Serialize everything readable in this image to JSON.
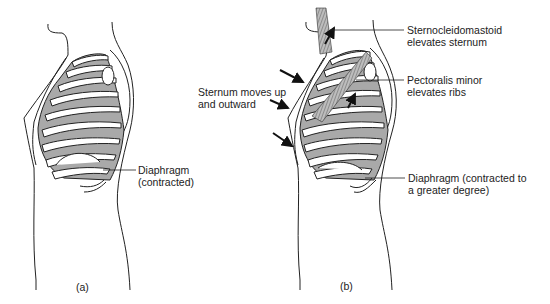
{
  "figure": {
    "panel_a": {
      "caption": "(a)",
      "labels": {
        "diaphragm_line1": "Diaphragm",
        "diaphragm_line2": "(contracted)"
      }
    },
    "panel_b": {
      "caption": "(b)",
      "labels": {
        "sternum_line1": "Sternum moves up",
        "sternum_line2": "and outward",
        "scm_line1": "Sternocleidomastoid",
        "scm_line2": "elevates sternum",
        "pec_line1": "Pectoralis minor",
        "pec_line2": "elevates ribs",
        "diaphragm_line1": "Diaphragm (contracted to",
        "diaphragm_line2": "a greater degree)"
      }
    },
    "colors": {
      "rib_space_fill": "#a9a9a9",
      "line": "#222222",
      "background": "#ffffff"
    }
  }
}
